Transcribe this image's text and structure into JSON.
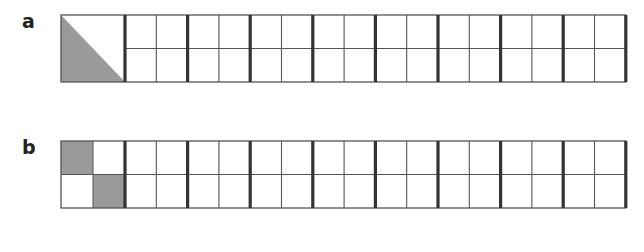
{
  "figures": [
    {
      "label": "a",
      "description": "First square shaded as lower-left triangle (half), followed by 8 blocks of 2x2 squares",
      "first_square_shading": "triangle-lower-left",
      "blocks_after_first": 8
    },
    {
      "label": "b",
      "description": "First square divided into 2x2 with top-left and bottom-right quarters shaded, followed by 8 blocks of 2x2 squares",
      "first_square_shading": "checker-diagonal",
      "blocks_after_first": 8
    }
  ],
  "colors": {
    "shade": "#9a9a9a",
    "thin_line": "#555555",
    "thick_line": "#333333"
  }
}
